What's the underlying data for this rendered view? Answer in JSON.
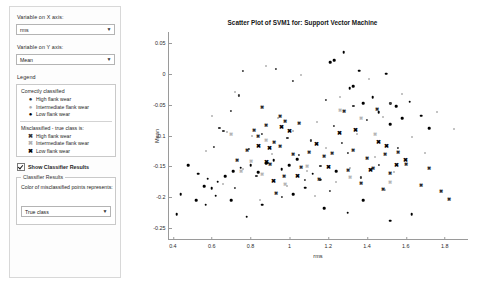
{
  "sidebar": {
    "x_axis_label": "Variable on X axis:",
    "x_axis_value": "rms",
    "y_axis_label": "Variable on Y axis:",
    "y_axis_value": "Mean",
    "legend_title": "Legend",
    "legend": {
      "correct_heading": "Correctly classified",
      "correct_items": [
        {
          "marker": "●",
          "label": "High flank wear",
          "color": "#333333"
        },
        {
          "marker": "●",
          "label": "Intermediate flank wear",
          "color": "#aaaaaa"
        },
        {
          "marker": "●",
          "label": "Low flank wear",
          "color": "#000000"
        }
      ],
      "misclassified_heading": "Misclassified - true class is:",
      "misclassified_items": [
        {
          "marker": "✖",
          "label": "High flank wear",
          "color": "#333333"
        },
        {
          "marker": "✖",
          "label": "Intermediate flank wear",
          "color": "#aaaaaa"
        },
        {
          "marker": "✖",
          "label": "Low flank wear",
          "color": "#000000"
        }
      ]
    },
    "show_classifier_results_label": "Show Classifier Results",
    "show_classifier_results_checked": true,
    "results_group_title": "Classifier Results",
    "results_description": "Color of misclassified points represents:",
    "color_represents_value": "True class"
  },
  "chart_data": {
    "type": "scatter",
    "title": "Scatter Plot of SVM1 for: Support Vector Machine",
    "xlabel": "rms",
    "ylabel": "Mean",
    "xlim": [
      0.38,
      1.92
    ],
    "ylim": [
      -0.268,
      0.068
    ],
    "xticks": [
      "0.4",
      "0.6",
      "0.8",
      "1",
      "1.2",
      "1.4",
      "1.6",
      "1.8"
    ],
    "xtickvals": [
      0.4,
      0.6,
      0.8,
      1.0,
      1.2,
      1.4,
      1.6,
      1.8
    ],
    "yticks": [
      "0.05",
      "0",
      "-0.05",
      "-0.1",
      "-0.15",
      "-0.2",
      "-0.25"
    ],
    "ytickvals": [
      0.05,
      0,
      -0.05,
      -0.1,
      -0.15,
      -0.2,
      -0.25
    ],
    "grid": false,
    "legend_position": "external-left",
    "series": [
      {
        "name": "Correctly classified - High flank wear",
        "marker": "dot",
        "color": "#3a3a3a",
        "size": 2.2,
        "points": [
          [
            0.76,
            0.005
          ],
          [
            0.93,
            0.008
          ],
          [
            1.02,
            -0.012
          ],
          [
            0.74,
            -0.035
          ],
          [
            1.19,
            -0.042
          ],
          [
            0.7,
            -0.06
          ],
          [
            1.33,
            -0.052
          ],
          [
            1.52,
            -0.048
          ],
          [
            0.64,
            -0.088
          ],
          [
            0.66,
            -0.092
          ],
          [
            1.23,
            -0.085
          ],
          [
            1.4,
            -0.075
          ],
          [
            0.86,
            -0.098
          ],
          [
            0.99,
            -0.104
          ],
          [
            1.11,
            -0.108
          ],
          [
            1.27,
            -0.112
          ],
          [
            0.61,
            -0.118
          ],
          [
            0.79,
            -0.122
          ],
          [
            1.05,
            -0.132
          ],
          [
            1.3,
            -0.128
          ],
          [
            0.89,
            -0.145
          ],
          [
            1.16,
            -0.15
          ],
          [
            1.46,
            -0.148
          ],
          [
            1.56,
            -0.12
          ],
          [
            0.83,
            -0.165
          ],
          [
            1.08,
            -0.172
          ],
          [
            1.37,
            -0.168
          ],
          [
            0.72,
            -0.185
          ],
          [
            1.21,
            -0.19
          ],
          [
            0.96,
            -0.2
          ]
        ]
      },
      {
        "name": "Correctly classified - Intermediate flank wear",
        "marker": "dot",
        "color": "#b0b0b0",
        "size": 2.0,
        "points": [
          [
            0.88,
            0.013
          ],
          [
            1.06,
            -0.002
          ],
          [
            1.41,
            -0.008
          ],
          [
            0.72,
            -0.03
          ],
          [
            1.26,
            -0.038
          ],
          [
            1.58,
            -0.032
          ],
          [
            0.6,
            -0.068
          ],
          [
            0.94,
            -0.072
          ],
          [
            1.14,
            -0.078
          ],
          [
            1.48,
            -0.07
          ],
          [
            1.76,
            -0.062
          ],
          [
            0.68,
            -0.095
          ],
          [
            0.81,
            -0.1
          ],
          [
            1.02,
            -0.092
          ],
          [
            1.35,
            -0.098
          ],
          [
            1.63,
            -0.102
          ],
          [
            1.85,
            -0.09
          ],
          [
            0.57,
            -0.125
          ],
          [
            0.91,
            -0.13
          ],
          [
            1.19,
            -0.12
          ],
          [
            1.44,
            -0.135
          ],
          [
            1.7,
            -0.128
          ],
          [
            0.76,
            -0.155
          ],
          [
            1.09,
            -0.158
          ],
          [
            1.31,
            -0.152
          ],
          [
            1.54,
            -0.16
          ],
          [
            0.66,
            -0.178
          ],
          [
            0.99,
            -0.182
          ],
          [
            1.24,
            -0.175
          ],
          [
            1.49,
            -0.188
          ],
          [
            0.85,
            -0.205
          ],
          [
            1.13,
            -0.198
          ]
        ]
      },
      {
        "name": "Correctly classified - Low flank wear",
        "marker": "dot",
        "color": "#000000",
        "size": 2.6,
        "points": [
          [
            1.28,
            0.035
          ],
          [
            1.23,
            0.022
          ],
          [
            1.21,
            0.019
          ],
          [
            1.36,
            0.005
          ],
          [
            1.5,
            0.0
          ],
          [
            1.33,
            -0.02
          ],
          [
            1.31,
            -0.023
          ],
          [
            1.43,
            -0.038
          ],
          [
            1.38,
            -0.048
          ],
          [
            1.55,
            -0.052
          ],
          [
            1.62,
            -0.045
          ],
          [
            1.46,
            -0.062
          ],
          [
            1.58,
            -0.072
          ],
          [
            1.68,
            -0.068
          ],
          [
            1.52,
            -0.082
          ],
          [
            1.72,
            -0.088
          ],
          [
            0.48,
            -0.148
          ],
          [
            0.53,
            -0.162
          ],
          [
            0.58,
            -0.17
          ],
          [
            0.56,
            -0.182
          ],
          [
            0.6,
            -0.186
          ],
          [
            0.63,
            -0.175
          ],
          [
            0.67,
            -0.166
          ],
          [
            0.71,
            -0.158
          ],
          [
            0.75,
            -0.152
          ],
          [
            0.8,
            -0.148
          ],
          [
            0.84,
            -0.16
          ],
          [
            0.88,
            -0.145
          ],
          [
            0.92,
            -0.14
          ],
          [
            0.96,
            -0.155
          ],
          [
            1.0,
            -0.148
          ],
          [
            1.04,
            -0.138
          ],
          [
            0.52,
            -0.205
          ],
          [
            0.62,
            -0.198
          ],
          [
            0.57,
            -0.212
          ],
          [
            0.7,
            -0.205
          ],
          [
            0.86,
            -0.212
          ],
          [
            1.02,
            -0.195
          ],
          [
            1.08,
            -0.185
          ],
          [
            0.78,
            -0.232
          ],
          [
            1.18,
            -0.218
          ],
          [
            1.38,
            -0.205
          ],
          [
            1.52,
            -0.238
          ],
          [
            1.63,
            -0.228
          ],
          [
            1.3,
            -0.225
          ],
          [
            0.44,
            -0.195
          ],
          [
            0.42,
            -0.228
          ],
          [
            1.12,
            -0.162
          ],
          [
            1.16,
            -0.172
          ],
          [
            1.24,
            -0.158
          ]
        ]
      },
      {
        "name": "Misclassified - High flank wear",
        "marker": "x",
        "color": "#2b2b2b",
        "size": 5.2,
        "points": [
          [
            0.86,
            -0.055
          ],
          [
            0.95,
            -0.07
          ],
          [
            0.98,
            -0.078
          ],
          [
            0.82,
            -0.092
          ],
          [
            0.88,
            -0.085
          ],
          [
            0.84,
            -0.102
          ],
          [
            1.05,
            -0.082
          ],
          [
            0.92,
            -0.112
          ],
          [
            0.95,
            -0.118
          ],
          [
            1.28,
            -0.062
          ],
          [
            1.45,
            -0.058
          ],
          [
            0.78,
            -0.125
          ],
          [
            1.02,
            -0.132
          ],
          [
            1.1,
            -0.128
          ],
          [
            1.18,
            -0.135
          ],
          [
            1.22,
            -0.13
          ],
          [
            1.33,
            -0.125
          ],
          [
            1.4,
            -0.138
          ],
          [
            1.49,
            -0.132
          ],
          [
            1.56,
            -0.128
          ],
          [
            0.73,
            -0.142
          ],
          [
            0.9,
            -0.148
          ],
          [
            1.06,
            -0.152
          ],
          [
            1.3,
            -0.158
          ],
          [
            1.43,
            -0.155
          ],
          [
            1.52,
            -0.162
          ],
          [
            1.6,
            -0.148
          ],
          [
            1.72,
            -0.155
          ],
          [
            0.97,
            -0.168
          ],
          [
            1.15,
            -0.172
          ],
          [
            1.37,
            -0.178
          ],
          [
            1.68,
            -0.182
          ],
          [
            1.48,
            -0.188
          ],
          [
            1.78,
            -0.192
          ],
          [
            1.82,
            -0.205
          ],
          [
            0.93,
            -0.195
          ]
        ]
      },
      {
        "name": "Misclassified - Intermediate flank wear",
        "marker": "x",
        "color": "#b5b5b5",
        "size": 5.0,
        "points": [
          [
            0.7,
            -0.098
          ],
          [
            0.88,
            -0.108
          ],
          [
            1.37,
            -0.072
          ],
          [
            1.26,
            -0.058
          ],
          [
            1.44,
            -0.098
          ],
          [
            0.8,
            -0.142
          ],
          [
            0.86,
            -0.162
          ],
          [
            1.09,
            -0.15
          ],
          [
            1.31,
            -0.168
          ],
          [
            0.98,
            -0.178
          ],
          [
            0.75,
            -0.158
          ],
          [
            1.52,
            -0.175
          ]
        ]
      },
      {
        "name": "Misclassified - Low flank wear",
        "marker": "x",
        "color": "#000000",
        "size": 5.6,
        "points": [
          [
            0.96,
            -0.088
          ],
          [
            1.0,
            -0.095
          ],
          [
            1.26,
            -0.098
          ],
          [
            1.34,
            -0.092
          ],
          [
            0.84,
            -0.118
          ],
          [
            0.9,
            -0.122
          ],
          [
            1.14,
            -0.115
          ],
          [
            1.46,
            -0.112
          ],
          [
            1.5,
            -0.118
          ],
          [
            0.88,
            -0.145
          ],
          [
            1.2,
            -0.152
          ],
          [
            1.42,
            -0.158
          ],
          [
            1.55,
            -0.15
          ],
          [
            1.6,
            -0.142
          ],
          [
            0.92,
            -0.175
          ],
          [
            1.04,
            -0.168
          ]
        ]
      }
    ]
  }
}
